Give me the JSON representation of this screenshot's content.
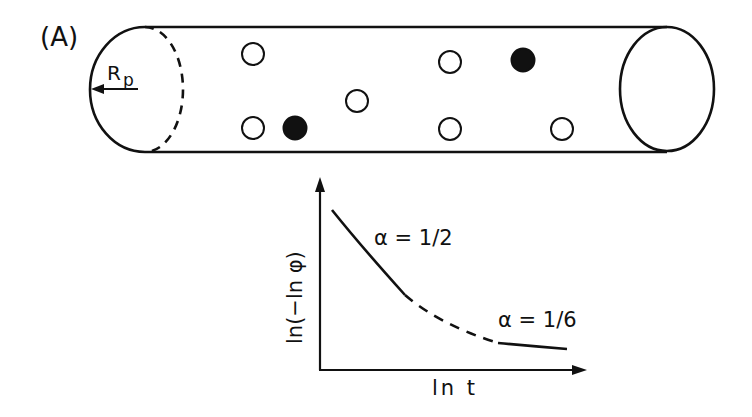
{
  "panel_label": "(A)",
  "pore": {
    "radius_label": "R",
    "radius_subscript": "p",
    "open_particles": [
      {
        "cx": 253,
        "cy": 54
      },
      {
        "cx": 253,
        "cy": 128
      },
      {
        "cx": 357,
        "cy": 101
      },
      {
        "cx": 450,
        "cy": 62
      },
      {
        "cx": 450,
        "cy": 129
      },
      {
        "cx": 562,
        "cy": 129
      }
    ],
    "filled_particles": [
      {
        "cx": 295,
        "cy": 128
      },
      {
        "cx": 523,
        "cy": 60
      }
    ]
  },
  "graph": {
    "y_axis_label": "ln(−ln φ)",
    "x_axis_label": "ln t",
    "regime1_label": "α = 1/2",
    "regime2_label": "α = 1/6"
  },
  "colors": {
    "ink": "#111111",
    "background": "#ffffff"
  }
}
